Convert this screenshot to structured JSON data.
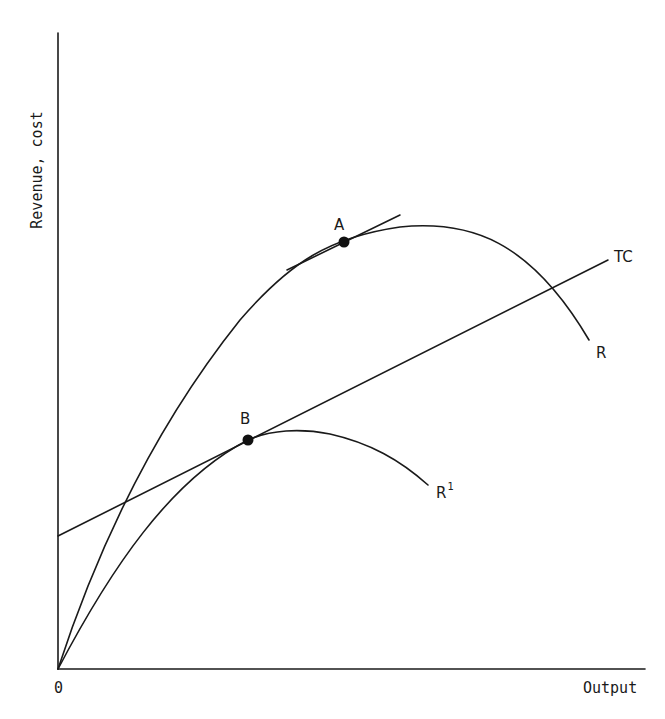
{
  "axes": {
    "y_label": "Revenue, cost",
    "x_label": "Output",
    "origin_label": "0"
  },
  "curves": {
    "R": {
      "label": "R"
    },
    "R1": {
      "label": "R",
      "superscript": "1"
    },
    "TC": {
      "label": "TC"
    }
  },
  "points": {
    "A": {
      "label": "A"
    },
    "B": {
      "label": "B"
    }
  },
  "colors": {
    "line": "#1a1a1a",
    "background": "#ffffff"
  }
}
